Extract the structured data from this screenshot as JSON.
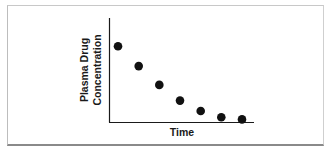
{
  "chart_data": {
    "type": "scatter",
    "title": "",
    "xlabel": "Time",
    "ylabel_lines": [
      "Plasma Drug",
      "Concentration"
    ],
    "ylabel": "Plasma Drug Concentration",
    "xticks": [],
    "yticks": [],
    "grid": false,
    "legend": null,
    "x": [
      1,
      2,
      3,
      4,
      5,
      6,
      7
    ],
    "y": [
      0.73,
      0.54,
      0.36,
      0.21,
      0.11,
      0.05,
      0.03
    ],
    "xlim": [
      0,
      8
    ],
    "ylim": [
      0,
      1
    ],
    "note": "Values are relative (no axis ticks shown); exponential-decay shape of plasma drug concentration over time."
  },
  "colors": {
    "points": "#111111",
    "axes": "#1a1a1a",
    "frame_bottom": "#8a8a8a",
    "frame": "#c8c8c8"
  }
}
